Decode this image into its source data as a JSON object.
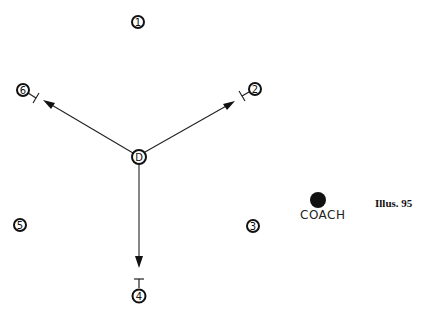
{
  "caption": "Illus. 95",
  "coach": {
    "label": "COACH",
    "x": 318,
    "y": 200,
    "r": 8
  },
  "center_player": {
    "label": "D",
    "x": 139,
    "y": 157
  },
  "players": [
    {
      "id": "1",
      "label": "1",
      "x": 138,
      "y": 22
    },
    {
      "id": "2",
      "label": "2",
      "x": 255,
      "y": 89
    },
    {
      "id": "3",
      "label": "3",
      "x": 253,
      "y": 226
    },
    {
      "id": "4",
      "label": "4",
      "x": 139,
      "y": 296
    },
    {
      "id": "5",
      "label": "5",
      "x": 20,
      "y": 225
    },
    {
      "id": "6",
      "label": "6",
      "x": 23,
      "y": 90
    }
  ],
  "passes": [
    {
      "from": "D",
      "to": "6",
      "x1": 133,
      "y1": 153,
      "x2": 44,
      "y2": 101
    },
    {
      "from": "D",
      "to": "2",
      "x1": 145,
      "y1": 152,
      "x2": 234,
      "y2": 102
    },
    {
      "from": "D",
      "to": "4",
      "x1": 139,
      "y1": 164,
      "x2": 139,
      "y2": 267
    }
  ],
  "colors": {
    "ink": "#111111",
    "background": "#ffffff"
  }
}
